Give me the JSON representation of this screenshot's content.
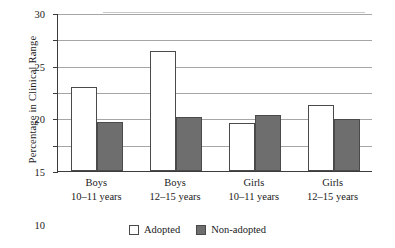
{
  "chart_data": {
    "type": "bar",
    "title": "",
    "xlabel": "",
    "ylabel": "Percentage in Clinical Range",
    "ylim": [
      0,
      30
    ],
    "yticks": [
      0,
      5,
      10,
      15,
      20,
      25,
      30
    ],
    "ytick_labels": [
      "0",
      "5",
      "10",
      "15",
      "20",
      "25",
      "30"
    ],
    "grid": true,
    "legend_position": "bottom-center",
    "categories": [
      {
        "line1": "Boys",
        "line2": "10–11 years"
      },
      {
        "line1": "Boys",
        "line2": "12–15 years"
      },
      {
        "line1": "Girls",
        "line2": "10–11 years"
      },
      {
        "line1": "Girls",
        "line2": "12–15 years"
      }
    ],
    "series": [
      {
        "name": "Adopted",
        "color": "#ffffff",
        "values": [
          16.0,
          22.8,
          9.2,
          12.6
        ]
      },
      {
        "name": "Non-adopted",
        "color": "#6e6e6e",
        "values": [
          9.3,
          10.2,
          10.6,
          9.8
        ]
      }
    ]
  },
  "legend": {
    "items": [
      {
        "label": "Adopted",
        "swatch": "white-square-icon"
      },
      {
        "label": "Non-adopted",
        "swatch": "gray-square-icon"
      }
    ]
  }
}
